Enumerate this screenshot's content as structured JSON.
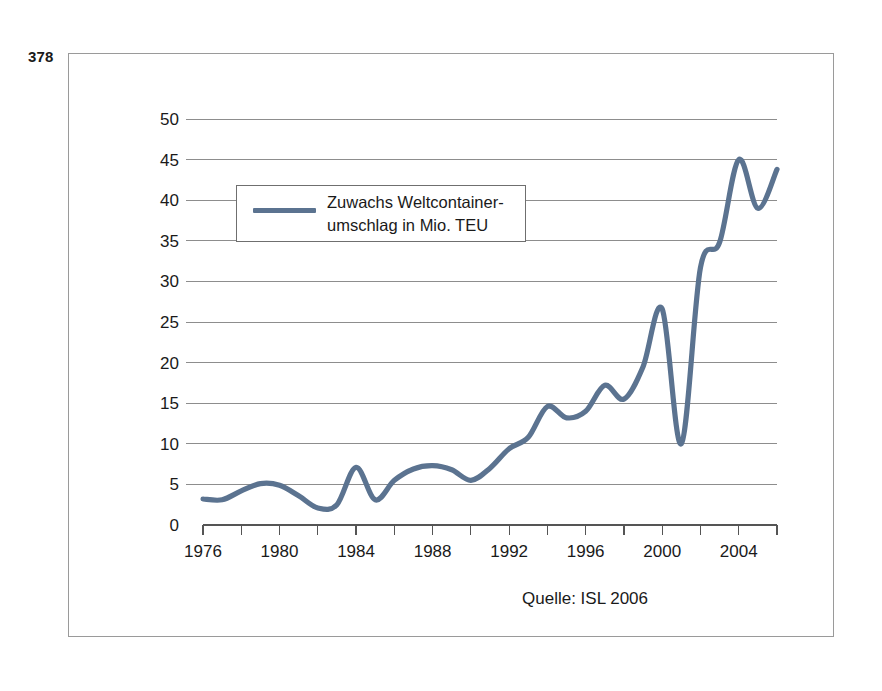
{
  "page": {
    "page_number": "378",
    "source_caption": "Quelle: ISL 2006"
  },
  "legend": {
    "label": "Zuwachs Weltcontainer-\numschlag in Mio. TEU",
    "line_color": "#5b7390",
    "swatch_name": "legend-line-swatch"
  },
  "chart_data": {
    "type": "line",
    "title": "",
    "subtitle": "",
    "xlabel": "",
    "ylabel": "",
    "legend_position": "top-left",
    "grid": true,
    "xlim": [
      1976,
      2006
    ],
    "ylim": [
      0,
      50
    ],
    "yticks": [
      0,
      5,
      10,
      15,
      20,
      25,
      30,
      35,
      40,
      45,
      50
    ],
    "ytick_labels": [
      "0",
      "5",
      "10",
      "15",
      "20",
      "25",
      "30",
      "35",
      "40",
      "45",
      "50"
    ],
    "xticks": [
      1976,
      1978,
      1980,
      1982,
      1984,
      1986,
      1988,
      1990,
      1992,
      1994,
      1996,
      1998,
      2000,
      2002,
      2004,
      2006
    ],
    "xtick_labels": [
      "1976",
      "",
      "1980",
      "",
      "1984",
      "",
      "1988",
      "",
      "1992",
      "",
      "1996",
      "",
      "2000",
      "",
      "2004",
      ""
    ],
    "series": [
      {
        "name": "Zuwachs Weltcontainerumschlag in Mio. TEU",
        "color": "#5b7390",
        "x": [
          1976,
          1977,
          1978,
          1979,
          1980,
          1981,
          1982,
          1983,
          1984,
          1985,
          1986,
          1987,
          1988,
          1989,
          1990,
          1991,
          1992,
          1993,
          1994,
          1995,
          1996,
          1997,
          1998,
          1999,
          2000,
          2001,
          2002,
          2003,
          2004,
          2005,
          2006
        ],
        "values": [
          3.2,
          3.1,
          4.2,
          5.1,
          4.9,
          3.6,
          2.1,
          2.5,
          7.1,
          3.1,
          5.5,
          6.9,
          7.3,
          6.8,
          5.5,
          7.0,
          9.4,
          10.8,
          14.6,
          13.2,
          14.0,
          17.2,
          15.5,
          19.5,
          26.6,
          10.0,
          31.7,
          34.8,
          45.0,
          39.0,
          43.8
        ],
        "annotations": []
      }
    ]
  }
}
